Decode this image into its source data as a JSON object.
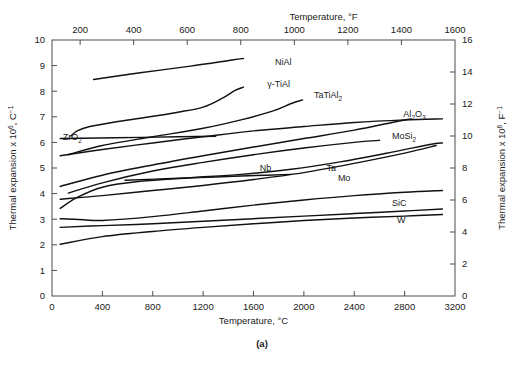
{
  "figure": {
    "caption": "(a)"
  },
  "chart_data": {
    "type": "line",
    "title": "",
    "xlabel": "Temperature, °C",
    "ylabel": "Thermal expansion x 10⁶, C⁻¹",
    "x2label": "Temperature, °F",
    "y2label": "Thermal expansion x 10⁶, F⁻¹",
    "xlim": [
      0,
      3200
    ],
    "ylim": [
      0,
      10
    ],
    "x2lim": [
      95,
      1600
    ],
    "y2lim": [
      0,
      16
    ],
    "grid": false,
    "legend": "inline-curve-labels",
    "xticks": [
      0,
      400,
      800,
      1200,
      1600,
      2000,
      2400,
      2800,
      3200
    ],
    "xticklabels": [
      "0",
      "400",
      "800",
      "1200",
      "1600",
      "2000",
      "2400",
      "2800",
      "3200"
    ],
    "yticks": [
      0,
      1,
      2,
      3,
      4,
      5,
      6,
      7,
      8,
      9,
      10
    ],
    "yticklabels": [
      "0",
      "1",
      "2",
      "3",
      "4",
      "5",
      "6",
      "7",
      "8",
      "9",
      "10"
    ],
    "x2ticks": [
      200,
      400,
      600,
      800,
      1000,
      1200,
      1400,
      1600
    ],
    "x2ticklabels": [
      "200",
      "400",
      "600",
      "800",
      "1000",
      "1200",
      "1400",
      "1600"
    ],
    "y2ticks": [
      0,
      2,
      4,
      6,
      8,
      10,
      12,
      14,
      16
    ],
    "y2ticklabels": [
      "0",
      "2",
      "4",
      "6",
      "8",
      "10",
      "12",
      "14",
      "16"
    ],
    "axis_labels": {
      "y_prefix": "Thermal expansion x 10",
      "y_exp": "6",
      "y_unit": ", C",
      "y_unit_exp": "−1",
      "y2_prefix": "Thermal expansion x 10",
      "y2_exp": "6",
      "y2_unit": ", F",
      "y2_unit_exp": "−1"
    },
    "series": [
      {
        "name": "NiAl",
        "label": "NiAl",
        "label_pos": [
          1770,
          9.02
        ],
        "points": [
          [
            330,
            8.46
          ],
          [
            700,
            8.72
          ],
          [
            1100,
            8.98
          ],
          [
            1430,
            9.22
          ],
          [
            1520,
            9.28
          ]
        ]
      },
      {
        "name": "gamma-TiAl",
        "label": "γ-TiAl",
        "label_pos": [
          1710,
          8.18
        ],
        "points": [
          [
            150,
            6.25
          ],
          [
            200,
            6.45
          ],
          [
            300,
            6.62
          ],
          [
            500,
            6.8
          ],
          [
            750,
            6.98
          ],
          [
            1000,
            7.18
          ],
          [
            1200,
            7.38
          ],
          [
            1350,
            7.72
          ],
          [
            1450,
            8.02
          ],
          [
            1520,
            8.16
          ]
        ]
      },
      {
        "name": "TaTiAl2",
        "label": "TaTiAl",
        "label_sub": "2",
        "label_pos": [
          2080,
          7.72
        ],
        "points": [
          [
            130,
            5.52
          ],
          [
            400,
            5.88
          ],
          [
            800,
            6.22
          ],
          [
            1200,
            6.55
          ],
          [
            1500,
            6.88
          ],
          [
            1750,
            7.22
          ],
          [
            1900,
            7.52
          ],
          [
            1990,
            7.66
          ]
        ]
      },
      {
        "name": "ZrO2",
        "label": "ZrO",
        "label_sub": "2",
        "label_pos": [
          85,
          6.08
        ],
        "points": [
          [
            65,
            6.15
          ],
          [
            500,
            6.18
          ],
          [
            1000,
            6.22
          ],
          [
            1300,
            6.24
          ]
        ]
      },
      {
        "name": "Al2O3",
        "label": "Al",
        "label_sub": "2",
        "label_sub2": "O",
        "label_sub3": "3",
        "label_pos": [
          2790,
          6.98
        ],
        "points": [
          [
            65,
            4.28
          ],
          [
            400,
            4.72
          ],
          [
            800,
            5.12
          ],
          [
            1200,
            5.48
          ],
          [
            1600,
            5.82
          ],
          [
            2000,
            6.15
          ],
          [
            2400,
            6.48
          ],
          [
            2700,
            6.78
          ],
          [
            2850,
            6.92
          ]
        ]
      },
      {
        "name": "MoSi2",
        "label": "MoSi",
        "label_sub": "2",
        "label_pos": [
          2700,
          6.12
        ],
        "points": [
          [
            130,
            4.02
          ],
          [
            400,
            4.42
          ],
          [
            800,
            4.88
          ],
          [
            1200,
            5.22
          ],
          [
            1600,
            5.52
          ],
          [
            2000,
            5.78
          ],
          [
            2400,
            6.0
          ],
          [
            2600,
            6.08
          ]
        ]
      },
      {
        "name": "Nb",
        "label": "Nb",
        "label_pos": [
          1650,
          4.88
        ],
        "points": [
          [
            580,
            4.52
          ],
          [
            900,
            4.58
          ],
          [
            1300,
            4.65
          ],
          [
            1700,
            4.72
          ],
          [
            1900,
            4.75
          ]
        ]
      },
      {
        "name": "Ta",
        "label": "Ta",
        "label_pos": [
          2180,
          4.88
        ],
        "points": [
          [
            65,
            3.42
          ],
          [
            200,
            3.85
          ],
          [
            400,
            4.25
          ],
          [
            700,
            4.48
          ],
          [
            1100,
            4.62
          ],
          [
            1500,
            4.75
          ],
          [
            1900,
            4.95
          ],
          [
            2300,
            5.25
          ],
          [
            2700,
            5.62
          ],
          [
            3000,
            5.92
          ],
          [
            3100,
            5.98
          ]
        ]
      },
      {
        "name": "Mo",
        "label": "Mo",
        "label_pos": [
          2270,
          4.48
        ],
        "points": [
          [
            65,
            3.78
          ],
          [
            400,
            3.92
          ],
          [
            800,
            4.12
          ],
          [
            1200,
            4.32
          ],
          [
            1600,
            4.55
          ],
          [
            2000,
            4.82
          ],
          [
            2400,
            5.18
          ],
          [
            2800,
            5.58
          ],
          [
            3050,
            5.88
          ]
        ]
      },
      {
        "name": "unlabeled-upper",
        "label": "",
        "points": [
          [
            65,
            5.48
          ],
          [
            400,
            5.72
          ],
          [
            800,
            5.98
          ],
          [
            1200,
            6.22
          ],
          [
            1600,
            6.45
          ],
          [
            2000,
            6.62
          ],
          [
            2400,
            6.78
          ],
          [
            2800,
            6.88
          ],
          [
            3100,
            6.92
          ]
        ]
      },
      {
        "name": "unlabeled-mid",
        "label": "",
        "points": [
          [
            65,
            3.02
          ],
          [
            250,
            2.98
          ],
          [
            400,
            2.95
          ],
          [
            800,
            3.1
          ],
          [
            1200,
            3.32
          ],
          [
            1600,
            3.55
          ],
          [
            2000,
            3.75
          ],
          [
            2400,
            3.92
          ],
          [
            2800,
            4.05
          ],
          [
            3100,
            4.12
          ]
        ]
      },
      {
        "name": "SiC",
        "label": "SiC",
        "label_pos": [
          2700,
          3.52
        ],
        "points": [
          [
            65,
            2.68
          ],
          [
            400,
            2.75
          ],
          [
            800,
            2.82
          ],
          [
            1200,
            2.92
          ],
          [
            1600,
            3.02
          ],
          [
            2000,
            3.12
          ],
          [
            2400,
            3.22
          ],
          [
            2800,
            3.32
          ],
          [
            3100,
            3.4
          ]
        ]
      },
      {
        "name": "W",
        "label": "W",
        "label_pos": [
          2740,
          2.85
        ],
        "points": [
          [
            65,
            2.02
          ],
          [
            400,
            2.32
          ],
          [
            800,
            2.52
          ],
          [
            1200,
            2.68
          ],
          [
            1600,
            2.82
          ],
          [
            2000,
            2.95
          ],
          [
            2400,
            3.05
          ],
          [
            2800,
            3.12
          ],
          [
            3100,
            3.18
          ]
        ]
      }
    ]
  }
}
